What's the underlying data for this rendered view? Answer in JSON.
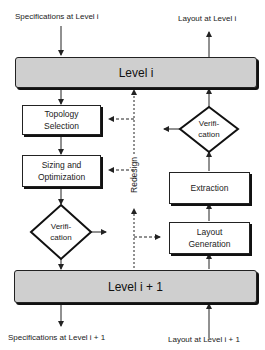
{
  "diagram": {
    "top_inputs": {
      "spec_label": "Specifications at Level i",
      "layout_label": "Layout at Level i"
    },
    "bottom_outputs": {
      "spec_label": "Specifications at Level i + 1",
      "layout_label": "Layout at Level i + 1"
    },
    "levels": {
      "upper": "Level i",
      "lower": "Level i + 1"
    },
    "left_column": {
      "topology": "Topology\nSelection",
      "topology_lines": [
        "Topology",
        "Selection"
      ],
      "sizing_lines": [
        "Sizing and",
        "Optimization"
      ],
      "verification_lines": [
        "Verifi-",
        "cation"
      ]
    },
    "right_column": {
      "verification_lines": [
        "Verifi-",
        "cation"
      ],
      "extraction": "Extraction",
      "layout_generation_lines": [
        "Layout",
        "Generation"
      ]
    },
    "redesign_label": "Redesign",
    "colors": {
      "level_bar": "#cfcfcf",
      "stroke": "#222222",
      "background": "#ffffff"
    }
  }
}
